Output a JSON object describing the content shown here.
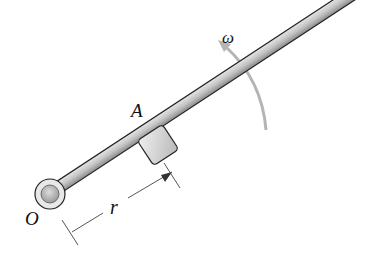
{
  "diagram": {
    "labels": {
      "pivot": "O",
      "collar": "A",
      "distance": "r",
      "angular_velocity": "ω"
    },
    "colors": {
      "rod_fill": "#b8b8b8",
      "rod_outline": "#222222",
      "arrow": "#b0b0b0",
      "dimension_line": "#555555"
    }
  }
}
